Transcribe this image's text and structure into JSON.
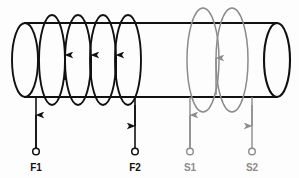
{
  "figure": {
    "name": "solenoid-transformer-winding-diagram",
    "background_color": "#fdfdfd",
    "primary_color": "#111111",
    "secondary_color": "#8c8c8c",
    "core": {
      "name": "cylindrical-core",
      "shape": "cylinder",
      "left_end_cx": 25,
      "right_end_cx": 277,
      "rx": 13,
      "ry": 37,
      "cy": 60
    },
    "primary_winding": {
      "name": "primary-coil",
      "turns": 4,
      "color": "#111111",
      "loop_centers_x": [
        52,
        78,
        103,
        128
      ],
      "loop_rx": 13,
      "loop_ry": 45,
      "arrow_direction": "up"
    },
    "secondary_winding": {
      "name": "secondary-coil",
      "turns": 2,
      "color": "#8c8c8c",
      "loop_centers_x": [
        203,
        232
      ],
      "loop_rx": 16,
      "loop_ry": 52,
      "arrow_direction": "up"
    },
    "terminals": [
      {
        "id": "F1",
        "label": "F1",
        "color": "#111111",
        "lead_x": 36,
        "lead_top_y": 97,
        "terminal_y": 152,
        "label_y": 170,
        "arrow_direction": "up",
        "winding": "primary"
      },
      {
        "id": "F2",
        "label": "F2",
        "color": "#111111",
        "lead_x": 135,
        "lead_top_y": 97,
        "terminal_y": 152,
        "label_y": 170,
        "arrow_direction": "down",
        "winding": "primary"
      },
      {
        "id": "S1",
        "label": "S1",
        "color": "#8c8c8c",
        "lead_x": 190,
        "lead_top_y": 97,
        "terminal_y": 152,
        "label_y": 170,
        "arrow_direction": "up",
        "winding": "secondary"
      },
      {
        "id": "S2",
        "label": "S2",
        "color": "#8c8c8c",
        "lead_x": 252,
        "lead_top_y": 97,
        "terminal_y": 152,
        "label_y": 170,
        "arrow_direction": "down",
        "winding": "secondary"
      }
    ]
  }
}
